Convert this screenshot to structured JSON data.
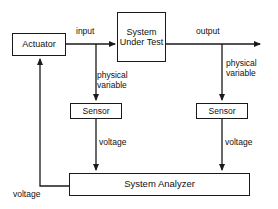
{
  "diagram": {
    "stroke_color": "#1a1a1a",
    "text_color": "#111111",
    "background_color": "#ffffff",
    "nodes": {
      "actuator": "Actuator",
      "system_under_test": "System\nUnder\nTest",
      "sensor_left": "Sensor",
      "sensor_right": "Sensor",
      "system_analyzer": "System Analyzer"
    },
    "edge_labels": {
      "input": "input",
      "output": "output",
      "physical_variable_left": "physical\nvariable",
      "physical_variable_right": "physical\nvariable",
      "voltage_left": "voltage",
      "voltage_right": "voltage",
      "voltage_feedback": "voltage"
    }
  }
}
